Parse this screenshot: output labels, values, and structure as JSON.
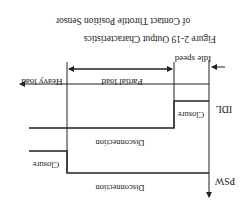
{
  "figure": {
    "orientation": "rotated-180",
    "caption_line1": "Figure 2-19   Output Characteristics",
    "caption_line2": "of Contact Throttle Position Sensor",
    "regions": {
      "idle": "Idle speed",
      "partial": "Partial load",
      "heavy": "Heavy load"
    },
    "signals": [
      {
        "name": "IDL",
        "states": [
          "Closure",
          "Disconnection"
        ]
      },
      {
        "name": "PSW",
        "states": [
          "Disconnection",
          "Closure"
        ]
      }
    ],
    "colors": {
      "line": "#222222",
      "background": "#ffffff"
    }
  }
}
